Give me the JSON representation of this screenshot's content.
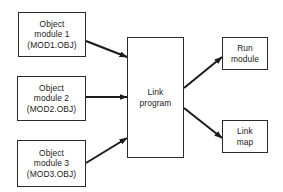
{
  "diagram": {
    "title": "",
    "inputs": [
      {
        "id": "mod1",
        "lines": [
          "Object",
          "module 1",
          "(MOD1.OBJ)"
        ]
      },
      {
        "id": "mod2",
        "lines": [
          "Object",
          "module 2",
          "(MOD2.OBJ)"
        ]
      },
      {
        "id": "mod3",
        "lines": [
          "Object",
          "module 3",
          "(MOD3.OBJ)"
        ]
      }
    ],
    "processor": {
      "id": "link",
      "lines": [
        "Link",
        "program"
      ]
    },
    "outputs": [
      {
        "id": "run",
        "lines": [
          "Run",
          "module"
        ]
      },
      {
        "id": "map",
        "lines": [
          "Link",
          "map"
        ]
      }
    ],
    "edges": [
      {
        "from": "mod1",
        "to": "link"
      },
      {
        "from": "mod2",
        "to": "link"
      },
      {
        "from": "mod3",
        "to": "link"
      },
      {
        "from": "link",
        "to": "run"
      },
      {
        "from": "link",
        "to": "map"
      }
    ],
    "colors": {
      "line": "#1a1a1a",
      "background": "#ffffff"
    }
  }
}
